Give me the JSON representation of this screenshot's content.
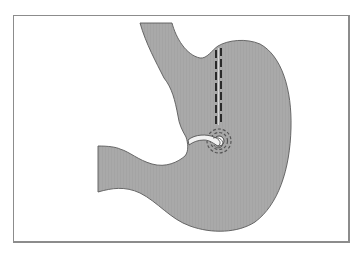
{
  "figure": {
    "elements": [
      {
        "name": "esophagus"
      },
      {
        "name": "gastric-pouch"
      },
      {
        "name": "vertical-staple-line",
        "style": "double dashed"
      },
      {
        "name": "gastric-band-ring"
      },
      {
        "name": "circular-staple-window"
      },
      {
        "name": "stomach-body"
      },
      {
        "name": "duodenum"
      }
    ],
    "colors": {
      "tissue_fill": "#a9a9a9",
      "tissue_outline": "#5a5a5a",
      "staple": "#2a2a2a",
      "band": "#f2f2f2",
      "frame": "#8c8c8c",
      "background": "#ffffff"
    }
  }
}
